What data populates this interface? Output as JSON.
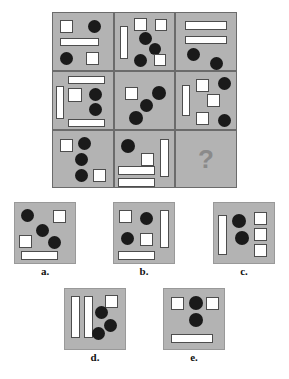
{
  "puzzle": {
    "type": "visual-analogy-matrix",
    "missing_cell_symbol": "?",
    "colors": {
      "panel_background": "#b3b3b3",
      "cell_border": "#6b6b6b",
      "circle_fill": "#1a1a1a",
      "square_fill": "#ffffff",
      "shape_outline": "#4d4d4d",
      "question_mark": "#8a8a8a",
      "page_background": "#ffffff"
    },
    "matrix": {
      "rows": 3,
      "columns": 3,
      "left": 52,
      "top": 12,
      "width": 185,
      "height": 176,
      "cells": [
        {
          "index": 0,
          "row": 0,
          "col": 0,
          "x": 0,
          "y": 0,
          "w": 62,
          "h": 59,
          "counts": {
            "circles": 2,
            "squares": 2,
            "bars_h": 1,
            "bars_v": 0
          },
          "shapes": [
            {
              "kind": "square",
              "x": 7,
              "y": 7,
              "w": 13,
              "h": 13
            },
            {
              "kind": "circle",
              "x": 35,
              "y": 7,
              "w": 13,
              "h": 13
            },
            {
              "kind": "bar-h",
              "x": 7,
              "y": 25,
              "w": 39,
              "h": 8
            },
            {
              "kind": "circle",
              "x": 7,
              "y": 39,
              "w": 13,
              "h": 13
            },
            {
              "kind": "square",
              "x": 33,
              "y": 39,
              "w": 13,
              "h": 13
            }
          ]
        },
        {
          "index": 1,
          "row": 0,
          "col": 1,
          "x": 62,
          "y": 0,
          "w": 61,
          "h": 59,
          "counts": {
            "circles": 3,
            "squares": 3,
            "bars_h": 0,
            "bars_v": 1
          },
          "shapes": [
            {
              "kind": "bar-v",
              "x": 5,
              "y": 13,
              "w": 8,
              "h": 33
            },
            {
              "kind": "square",
              "x": 19,
              "y": 5,
              "w": 13,
              "h": 13
            },
            {
              "kind": "square",
              "x": 40,
              "y": 6,
              "w": 12,
              "h": 12
            },
            {
              "kind": "circle",
              "x": 24,
              "y": 19,
              "w": 13,
              "h": 13
            },
            {
              "kind": "circle",
              "x": 34,
              "y": 30,
              "w": 12,
              "h": 12
            },
            {
              "kind": "circle",
              "x": 19,
              "y": 41,
              "w": 13,
              "h": 13
            },
            {
              "kind": "square",
              "x": 39,
              "y": 41,
              "w": 12,
              "h": 12
            }
          ]
        },
        {
          "index": 2,
          "row": 0,
          "col": 2,
          "x": 123,
          "y": 0,
          "w": 62,
          "h": 59,
          "counts": {
            "circles": 2,
            "squares": 0,
            "bars_h": 2,
            "bars_v": 0
          },
          "shapes": [
            {
              "kind": "bar-h",
              "x": 9,
              "y": 8,
              "w": 42,
              "h": 9
            },
            {
              "kind": "bar-h",
              "x": 9,
              "y": 23,
              "w": 42,
              "h": 8
            },
            {
              "kind": "circle",
              "x": 11,
              "y": 35,
              "w": 13,
              "h": 13
            },
            {
              "kind": "circle",
              "x": 34,
              "y": 44,
              "w": 13,
              "h": 13
            }
          ]
        },
        {
          "index": 3,
          "row": 1,
          "col": 0,
          "x": 0,
          "y": 59,
          "w": 62,
          "h": 59,
          "counts": {
            "circles": 2,
            "squares": 1,
            "bars_h": 2,
            "bars_v": 1
          },
          "shapes": [
            {
              "kind": "bar-h",
              "x": 15,
              "y": 4,
              "w": 37,
              "h": 8
            },
            {
              "kind": "bar-v",
              "x": 3,
              "y": 14,
              "w": 8,
              "h": 33
            },
            {
              "kind": "square",
              "x": 15,
              "y": 16,
              "w": 14,
              "h": 14
            },
            {
              "kind": "circle",
              "x": 36,
              "y": 16,
              "w": 13,
              "h": 13
            },
            {
              "kind": "circle",
              "x": 36,
              "y": 31,
              "w": 13,
              "h": 13
            },
            {
              "kind": "bar-h",
              "x": 15,
              "y": 47,
              "w": 37,
              "h": 8
            }
          ]
        },
        {
          "index": 4,
          "row": 1,
          "col": 1,
          "x": 62,
          "y": 59,
          "w": 61,
          "h": 59,
          "counts": {
            "circles": 3,
            "squares": 1,
            "bars_h": 0,
            "bars_v": 0
          },
          "shapes": [
            {
              "kind": "square",
              "x": 10,
              "y": 15,
              "w": 13,
              "h": 13
            },
            {
              "kind": "circle",
              "x": 37,
              "y": 14,
              "w": 14,
              "h": 14
            },
            {
              "kind": "circle",
              "x": 25,
              "y": 27,
              "w": 13,
              "h": 13
            },
            {
              "kind": "circle",
              "x": 14,
              "y": 39,
              "w": 14,
              "h": 14
            }
          ]
        },
        {
          "index": 5,
          "row": 1,
          "col": 2,
          "x": 123,
          "y": 59,
          "w": 62,
          "h": 59,
          "counts": {
            "circles": 3,
            "squares": 3,
            "bars_h": 0,
            "bars_v": 1
          },
          "shapes": [
            {
              "kind": "bar-v",
              "x": 6,
              "y": 13,
              "w": 8,
              "h": 31
            },
            {
              "kind": "square",
              "x": 20,
              "y": 7,
              "w": 13,
              "h": 13
            },
            {
              "kind": "circle",
              "x": 42,
              "y": 5,
              "w": 13,
              "h": 13
            },
            {
              "kind": "square",
              "x": 31,
              "y": 22,
              "w": 13,
              "h": 13
            },
            {
              "kind": "square",
              "x": 20,
              "y": 40,
              "w": 13,
              "h": 13
            },
            {
              "kind": "circle",
              "x": 42,
              "y": 42,
              "w": 13,
              "h": 13
            }
          ]
        },
        {
          "index": 6,
          "row": 2,
          "col": 0,
          "x": 0,
          "y": 118,
          "w": 62,
          "h": 58,
          "counts": {
            "circles": 3,
            "squares": 2,
            "bars_h": 0,
            "bars_v": 0
          },
          "shapes": [
            {
              "kind": "square",
              "x": 7,
              "y": 8,
              "w": 13,
              "h": 13
            },
            {
              "kind": "circle",
              "x": 25,
              "y": 6,
              "w": 13,
              "h": 13
            },
            {
              "kind": "circle",
              "x": 22,
              "y": 22,
              "w": 13,
              "h": 13
            },
            {
              "kind": "circle",
              "x": 22,
              "y": 38,
              "w": 13,
              "h": 13
            },
            {
              "kind": "square",
              "x": 40,
              "y": 38,
              "w": 13,
              "h": 13
            }
          ]
        },
        {
          "index": 7,
          "row": 2,
          "col": 1,
          "x": 62,
          "y": 118,
          "w": 61,
          "h": 58,
          "counts": {
            "circles": 1,
            "squares": 1,
            "bars_h": 2,
            "bars_v": 1
          },
          "shapes": [
            {
              "kind": "circle",
              "x": 6,
              "y": 8,
              "w": 14,
              "h": 14
            },
            {
              "kind": "square",
              "x": 26,
              "y": 22,
              "w": 13,
              "h": 13
            },
            {
              "kind": "bar-v",
              "x": 45,
              "y": 8,
              "w": 9,
              "h": 38
            },
            {
              "kind": "bar-h",
              "x": 3,
              "y": 35,
              "w": 37,
              "h": 9
            },
            {
              "kind": "bar-h",
              "x": 3,
              "y": 47,
              "w": 37,
              "h": 9
            }
          ]
        },
        {
          "index": 8,
          "row": 2,
          "col": 2,
          "x": 123,
          "y": 118,
          "w": 62,
          "h": 58,
          "is_missing": true,
          "counts": {
            "circles": 0,
            "squares": 0,
            "bars_h": 0,
            "bars_v": 0
          },
          "shapes": []
        }
      ]
    },
    "options": [
      {
        "id": "a",
        "label": "a.",
        "left": 14,
        "top": 202,
        "w": 62,
        "h": 62,
        "label_top": 265,
        "counts": {
          "circles": 3,
          "squares": 2,
          "bars_h": 1,
          "bars_v": 0
        },
        "shapes": [
          {
            "kind": "circle",
            "x": 6,
            "y": 6,
            "w": 13,
            "h": 13
          },
          {
            "kind": "square",
            "x": 38,
            "y": 7,
            "w": 13,
            "h": 13
          },
          {
            "kind": "circle",
            "x": 21,
            "y": 21,
            "w": 13,
            "h": 13
          },
          {
            "kind": "square",
            "x": 4,
            "y": 32,
            "w": 13,
            "h": 13
          },
          {
            "kind": "circle",
            "x": 33,
            "y": 33,
            "w": 13,
            "h": 13
          },
          {
            "kind": "bar-h",
            "x": 6,
            "y": 48,
            "w": 37,
            "h": 9
          }
        ]
      },
      {
        "id": "b",
        "label": "b.",
        "left": 113,
        "top": 202,
        "w": 62,
        "h": 62,
        "label_top": 265,
        "counts": {
          "circles": 2,
          "squares": 2,
          "bars_h": 1,
          "bars_v": 1
        },
        "shapes": [
          {
            "kind": "square",
            "x": 5,
            "y": 7,
            "w": 13,
            "h": 13
          },
          {
            "kind": "circle",
            "x": 26,
            "y": 9,
            "w": 13,
            "h": 13
          },
          {
            "kind": "bar-v",
            "x": 46,
            "y": 7,
            "w": 9,
            "h": 38
          },
          {
            "kind": "circle",
            "x": 7,
            "y": 29,
            "w": 13,
            "h": 13
          },
          {
            "kind": "square",
            "x": 26,
            "y": 30,
            "w": 13,
            "h": 13
          },
          {
            "kind": "bar-h",
            "x": 4,
            "y": 48,
            "w": 37,
            "h": 9
          }
        ]
      },
      {
        "id": "c",
        "label": "c.",
        "left": 213,
        "top": 202,
        "w": 62,
        "h": 62,
        "label_top": 265,
        "counts": {
          "circles": 2,
          "squares": 3,
          "bars_h": 0,
          "bars_v": 1
        },
        "shapes": [
          {
            "kind": "bar-v",
            "x": 4,
            "y": 12,
            "w": 9,
            "h": 40
          },
          {
            "kind": "circle",
            "x": 18,
            "y": 11,
            "w": 14,
            "h": 14
          },
          {
            "kind": "square",
            "x": 40,
            "y": 9,
            "w": 13,
            "h": 13
          },
          {
            "kind": "square",
            "x": 40,
            "y": 25,
            "w": 13,
            "h": 13
          },
          {
            "kind": "circle",
            "x": 21,
            "y": 28,
            "w": 14,
            "h": 14
          },
          {
            "kind": "square",
            "x": 40,
            "y": 41,
            "w": 13,
            "h": 13
          }
        ]
      },
      {
        "id": "d",
        "label": "d.",
        "left": 64,
        "top": 288,
        "w": 62,
        "h": 62,
        "label_top": 351,
        "counts": {
          "circles": 3,
          "squares": 1,
          "bars_h": 0,
          "bars_v": 2
        },
        "shapes": [
          {
            "kind": "bar-v",
            "x": 6,
            "y": 7,
            "w": 9,
            "h": 42
          },
          {
            "kind": "bar-v",
            "x": 19,
            "y": 7,
            "w": 9,
            "h": 42
          },
          {
            "kind": "square",
            "x": 40,
            "y": 6,
            "w": 13,
            "h": 13
          },
          {
            "kind": "circle",
            "x": 30,
            "y": 17,
            "w": 13,
            "h": 13
          },
          {
            "kind": "circle",
            "x": 39,
            "y": 30,
            "w": 13,
            "h": 13
          },
          {
            "kind": "circle",
            "x": 27,
            "y": 38,
            "w": 13,
            "h": 13
          }
        ]
      },
      {
        "id": "e",
        "label": "e.",
        "left": 163,
        "top": 288,
        "w": 62,
        "h": 62,
        "label_top": 351,
        "counts": {
          "circles": 2,
          "squares": 2,
          "bars_h": 1,
          "bars_v": 0
        },
        "shapes": [
          {
            "kind": "square",
            "x": 7,
            "y": 8,
            "w": 13,
            "h": 13
          },
          {
            "kind": "circle",
            "x": 25,
            "y": 7,
            "w": 14,
            "h": 14
          },
          {
            "kind": "square",
            "x": 42,
            "y": 8,
            "w": 13,
            "h": 13
          },
          {
            "kind": "circle",
            "x": 25,
            "y": 24,
            "w": 14,
            "h": 14
          },
          {
            "kind": "bar-h",
            "x": 7,
            "y": 45,
            "w": 42,
            "h": 9
          }
        ]
      }
    ]
  }
}
